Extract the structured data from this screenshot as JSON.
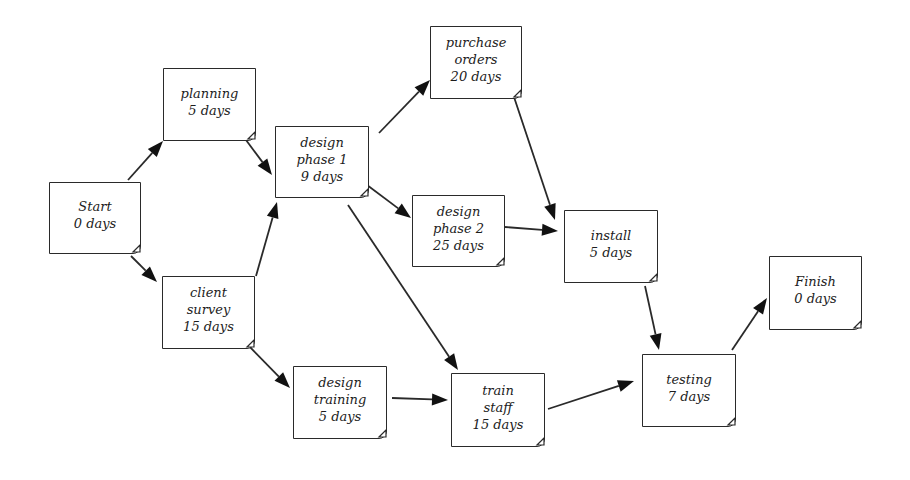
{
  "diagram": {
    "type": "activity-network (PERT)",
    "background": "#ffffff",
    "line_color": "#2a2a2a",
    "nodes": [
      {
        "id": "start",
        "lines": [
          "Start",
          "0 days"
        ],
        "x": 49,
        "y": 182,
        "w": 92,
        "h": 72
      },
      {
        "id": "planning",
        "lines": [
          "planning",
          "5 days"
        ],
        "x": 163,
        "y": 68,
        "w": 93,
        "h": 73
      },
      {
        "id": "client_survey",
        "lines": [
          "client",
          "survey",
          "15 days"
        ],
        "x": 162,
        "y": 276,
        "w": 93,
        "h": 73
      },
      {
        "id": "design_phase_1",
        "lines": [
          "design",
          "phase 1",
          "9 days"
        ],
        "x": 275,
        "y": 126,
        "w": 94,
        "h": 72
      },
      {
        "id": "purchase_orders",
        "lines": [
          "purchase",
          "orders",
          "20 days"
        ],
        "x": 430,
        "y": 26,
        "w": 92,
        "h": 73
      },
      {
        "id": "design_phase_2",
        "lines": [
          "design",
          "phase 2",
          "25 days"
        ],
        "x": 412,
        "y": 195,
        "w": 93,
        "h": 72
      },
      {
        "id": "design_training",
        "lines": [
          "design",
          "training",
          "5 days"
        ],
        "x": 293,
        "y": 366,
        "w": 94,
        "h": 73
      },
      {
        "id": "train_staff",
        "lines": [
          "train",
          "staff",
          "15 days"
        ],
        "x": 451,
        "y": 373,
        "w": 94,
        "h": 74
      },
      {
        "id": "install",
        "lines": [
          "install",
          "5 days"
        ],
        "x": 564,
        "y": 210,
        "w": 94,
        "h": 73
      },
      {
        "id": "testing",
        "lines": [
          "testing",
          "7 days"
        ],
        "x": 642,
        "y": 354,
        "w": 94,
        "h": 73
      },
      {
        "id": "finish",
        "lines": [
          "Finish",
          "0 days"
        ],
        "x": 769,
        "y": 256,
        "w": 93,
        "h": 74
      }
    ],
    "edges": [
      {
        "from": "start",
        "to": "planning",
        "x1": 128,
        "y1": 180,
        "x2": 163,
        "y2": 141
      },
      {
        "from": "start",
        "to": "client_survey",
        "x1": 131,
        "y1": 256,
        "x2": 157,
        "y2": 282
      },
      {
        "from": "planning",
        "to": "design_phase_1",
        "x1": 246,
        "y1": 140,
        "x2": 272,
        "y2": 175
      },
      {
        "from": "client_survey",
        "to": "design_phase_1",
        "x1": 256,
        "y1": 276,
        "x2": 277,
        "y2": 202
      },
      {
        "from": "client_survey",
        "to": "design_training",
        "x1": 246,
        "y1": 343,
        "x2": 290,
        "y2": 388
      },
      {
        "from": "design_phase_1",
        "to": "purchase_orders",
        "x1": 379,
        "y1": 133,
        "x2": 430,
        "y2": 80
      },
      {
        "from": "design_phase_1",
        "to": "design_phase_2",
        "x1": 367,
        "y1": 185,
        "x2": 411,
        "y2": 218
      },
      {
        "from": "design_phase_1",
        "to": "train_staff",
        "x1": 348,
        "y1": 205,
        "x2": 458,
        "y2": 370
      },
      {
        "from": "purchase_orders",
        "to": "install",
        "x1": 514,
        "y1": 97,
        "x2": 555,
        "y2": 220
      },
      {
        "from": "design_phase_2",
        "to": "install",
        "x1": 505,
        "y1": 227,
        "x2": 558,
        "y2": 231
      },
      {
        "from": "design_training",
        "to": "train_staff",
        "x1": 392,
        "y1": 398,
        "x2": 448,
        "y2": 400
      },
      {
        "from": "install",
        "to": "testing",
        "x1": 645,
        "y1": 286,
        "x2": 659,
        "y2": 350
      },
      {
        "from": "train_staff",
        "to": "testing",
        "x1": 548,
        "y1": 409,
        "x2": 634,
        "y2": 381
      },
      {
        "from": "testing",
        "to": "finish",
        "x1": 732,
        "y1": 350,
        "x2": 767,
        "y2": 298
      }
    ]
  }
}
